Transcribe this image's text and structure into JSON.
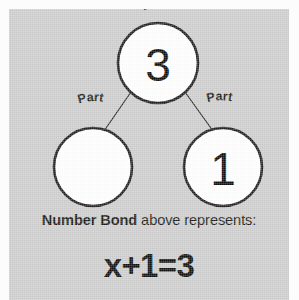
{
  "card": {
    "background_color": "#cdcdcd",
    "page_background_color": "#fcfcfc"
  },
  "diagram": {
    "type": "number-bond",
    "stroke_color": "#231f20",
    "circle_fill_color": "#ffffff",
    "whole": {
      "label": "Whole",
      "value": "3"
    },
    "parts": [
      {
        "label": "Part",
        "value": ""
      },
      {
        "label": "Part",
        "value": "1"
      }
    ]
  },
  "caption": {
    "bold_text": "Number Bond",
    "rest_text": " above represents:"
  },
  "equation": {
    "text": "x+1=3"
  }
}
